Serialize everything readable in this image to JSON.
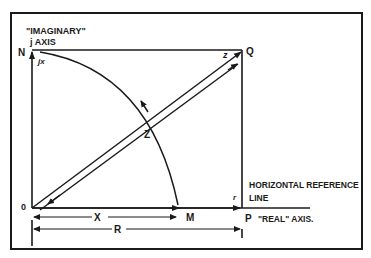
{
  "diagram": {
    "labels": {
      "imaginary_axis_line1": "\"IMAGINARY\"",
      "imaginary_axis_line2": "j AXIS",
      "point_n": "N",
      "point_q": "Q",
      "point_o": "0",
      "point_m": "M",
      "point_p": "P",
      "jx": "jx",
      "z_upper": "z",
      "z_main": "Z",
      "r_small": "r",
      "x_dim": "X",
      "r_dim": "R",
      "horizontal_ref_line1": "HORIZONTAL REFERENCE",
      "horizontal_ref_line2": "LINE",
      "real_axis": "\"REAL\" AXIS."
    },
    "colors": {
      "ink": "#1a1a1a",
      "background": "#ffffff"
    }
  }
}
